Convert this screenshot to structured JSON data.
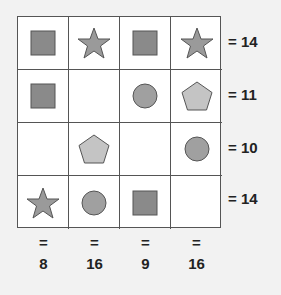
{
  "puzzle": {
    "colors": {
      "square": "#8a8a8a",
      "star": "#9a9a9a",
      "circle": "#a0a0a0",
      "pentagon": "#c4c4c4",
      "stroke": "#555555"
    },
    "grid": [
      [
        "square",
        "star",
        "square",
        "star"
      ],
      [
        "square",
        "empty",
        "circle",
        "pentagon"
      ],
      [
        "empty",
        "pentagon",
        "empty",
        "circle"
      ],
      [
        "star",
        "circle",
        "square",
        "empty"
      ]
    ],
    "row_sums": [
      "= 14",
      "= 11",
      "= 10",
      "= 14"
    ],
    "col_sums": [
      {
        "eq": "=",
        "value": "8"
      },
      {
        "eq": "=",
        "value": "16"
      },
      {
        "eq": "=",
        "value": "9"
      },
      {
        "eq": "=",
        "value": "16"
      }
    ]
  }
}
